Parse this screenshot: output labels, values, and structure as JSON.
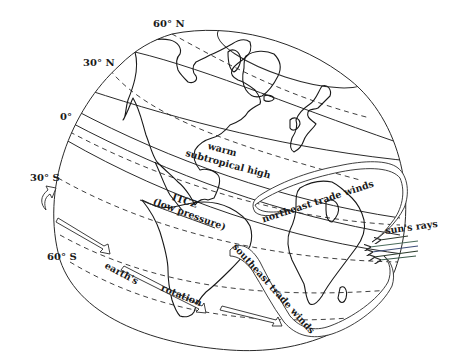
{
  "diagram": {
    "latitude_labels": {
      "n60": "60° N",
      "n30": "30° N",
      "equator": "0°",
      "s30": "30° S",
      "s60": "60° S"
    },
    "regions": {
      "subtropical_line1": "warm",
      "subtropical_line2": "subtropical high",
      "itcz_line1": "ITCZ",
      "itcz_line2": "(low pressure)"
    },
    "winds": {
      "northeast": "northeast trade winds",
      "southeast": "southeast trade winds"
    },
    "sun": {
      "label": "sun's rays",
      "ray_colors": [
        "#2f3a2f",
        "#4a6b5a",
        "#3f4f7a",
        "#2a3a2a",
        "#3a5a4a"
      ]
    },
    "rotation": {
      "line1": "earth's",
      "line2": "rotation"
    },
    "colors": {
      "line": "#1a1a1a",
      "background": "#ffffff"
    }
  }
}
